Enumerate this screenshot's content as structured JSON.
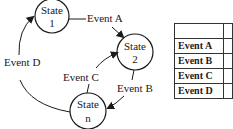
{
  "diagram": {
    "states": [
      {
        "id": "s1",
        "line1": "State",
        "line2": "1"
      },
      {
        "id": "s2",
        "line1": "State",
        "line2": "2"
      },
      {
        "id": "sn",
        "line1": "State",
        "line2": "n"
      }
    ],
    "transitions": [
      {
        "label": "Event A",
        "from": "State 1",
        "to": "State 2"
      },
      {
        "label": "Event B",
        "from": "State 2",
        "to": "State n"
      },
      {
        "label": "Event C",
        "from": "State n",
        "to": "State 2"
      },
      {
        "label": "Event D",
        "from": "State n",
        "to": "State 1"
      }
    ]
  },
  "table": {
    "header": [
      "",
      ""
    ],
    "rows": [
      {
        "event": "Event A",
        "value": ""
      },
      {
        "event": "Event B",
        "value": ""
      },
      {
        "event": "Event C",
        "value": ""
      },
      {
        "event": "Event D",
        "value": ""
      }
    ]
  },
  "colors": {
    "stroke": "#1a1a1a",
    "background": "#ffffff"
  }
}
